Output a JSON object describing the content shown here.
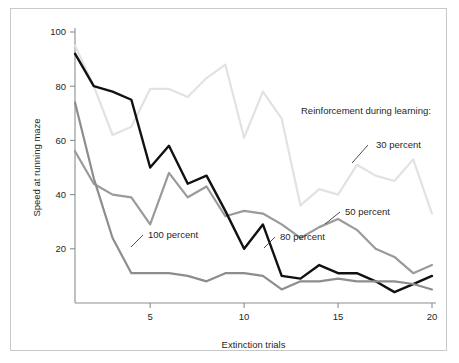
{
  "chart_data": {
    "type": "line",
    "title": "",
    "xlabel": "Extinction trials",
    "ylabel": "Speed at running maze",
    "xlim": [
      1,
      20
    ],
    "ylim": [
      0,
      100
    ],
    "xticks": [
      5,
      10,
      15,
      20
    ],
    "xtick_labels": [
      "5",
      "10",
      "15",
      "20"
    ],
    "yticks": [
      20,
      40,
      60,
      80,
      100
    ],
    "ytick_labels": [
      "20",
      "40",
      "60",
      "80",
      "100"
    ],
    "grid": false,
    "legend_position": "inline-annotations",
    "legend_title": "Reinforcement during learning:",
    "x": [
      1,
      2,
      3,
      4,
      5,
      6,
      7,
      8,
      9,
      10,
      11,
      12,
      13,
      14,
      15,
      16,
      17,
      18,
      19,
      20
    ],
    "series": [
      {
        "name": "30 percent",
        "color": "#e2e2e2",
        "width": 2.2,
        "label": "30 percent",
        "values": [
          95,
          80,
          62,
          65,
          79,
          79,
          76,
          83,
          88,
          61,
          78,
          68,
          36,
          42,
          40,
          51,
          47,
          45,
          53,
          33
        ]
      },
      {
        "name": "50 percent",
        "color": "#9a9a9a",
        "width": 2.2,
        "label": "50 percent",
        "values": [
          56,
          44,
          40,
          39,
          29,
          48,
          39,
          43,
          32,
          34,
          33,
          29,
          24,
          28,
          31,
          27,
          20,
          17,
          11,
          14
        ]
      },
      {
        "name": "80 percent",
        "color": "#111111",
        "width": 2.4,
        "label": "80 percent",
        "values": [
          92,
          80,
          78,
          75,
          50,
          58,
          44,
          47,
          34,
          20,
          29,
          10,
          9,
          14,
          11,
          11,
          8,
          4,
          7,
          10
        ]
      },
      {
        "name": "100 percent",
        "color": "#8d8d8d",
        "width": 2.2,
        "label": "100 percent",
        "values": [
          74,
          46,
          24,
          11,
          11,
          11,
          10,
          8,
          11,
          11,
          10,
          5,
          8,
          8,
          9,
          8,
          8,
          8,
          7,
          5
        ]
      }
    ],
    "annotations": [
      {
        "text": "Reinforcement during learning:",
        "x_px": 301,
        "y_px": 114,
        "leader": null,
        "anchor": "start"
      },
      {
        "text": "30 percent",
        "x_px": 376,
        "y_px": 148,
        "leader": [
          368,
          145,
          352,
          163
        ],
        "anchor": "start"
      },
      {
        "text": "50 percent",
        "x_px": 345,
        "y_px": 215,
        "leader": [
          340,
          212,
          325,
          224
        ],
        "anchor": "start"
      },
      {
        "text": "80 percent",
        "x_px": 280,
        "y_px": 240,
        "leader": [
          275,
          237,
          264,
          248
        ],
        "anchor": "start"
      },
      {
        "text": "100 percent",
        "x_px": 148,
        "y_px": 238,
        "leader": [
          143,
          235,
          131,
          247
        ],
        "anchor": "start"
      }
    ]
  }
}
